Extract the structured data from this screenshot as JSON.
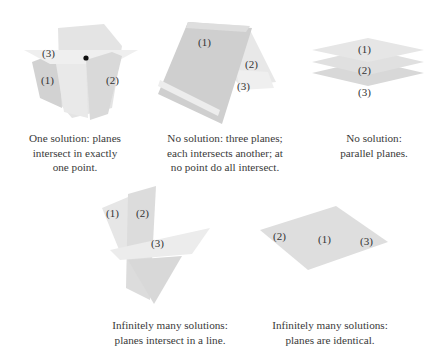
{
  "figures": [
    {
      "id": "one-point",
      "labels": [
        "(3)",
        "(1)",
        "(2)"
      ],
      "caption": [
        "One solution: planes",
        "intersect in exactly",
        "one point."
      ]
    },
    {
      "id": "no-solution-three-lines",
      "labels": [
        "(1)",
        "(2)",
        "(3)"
      ],
      "caption": [
        "No solution: three planes;",
        "each intersects another; at",
        "no point do all intersect."
      ]
    },
    {
      "id": "parallel",
      "labels": [
        "(1)",
        "(2)",
        "(3)"
      ],
      "caption": [
        "No solution:",
        "parallel planes."
      ]
    },
    {
      "id": "line",
      "labels": [
        "(1)",
        "(2)",
        "(3)"
      ],
      "caption": [
        "Infinitely many solutions:",
        "planes intersect in a line."
      ]
    },
    {
      "id": "identical",
      "labels": [
        "(2)",
        "(1)",
        "(3)"
      ],
      "caption": [
        "Infinitely many solutions:",
        "planes are identical."
      ]
    }
  ],
  "colors": {
    "plane_light": "#ececec",
    "plane_mid": "#dcdcdc",
    "plane_dark": "#cfcfcf",
    "point": "#111111"
  }
}
